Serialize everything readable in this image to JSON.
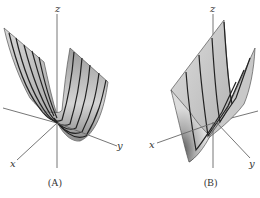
{
  "figures": [
    {
      "id": "A",
      "caption": "(A)",
      "axes": {
        "x": "x",
        "y": "y",
        "z": "z"
      },
      "surface": "parabolic cylinder trough, rulings parallel to y-axis direction"
    },
    {
      "id": "B",
      "caption": "(B)",
      "axes": {
        "x": "x",
        "y": "y",
        "z": "z"
      },
      "surface": "parabolic cylinder trough, rulings parallel to x-axis direction"
    }
  ],
  "colors": {
    "surface_light": "#e6e6e6",
    "surface_mid": "#b8b8b8",
    "surface_dark": "#7a7a7a",
    "axis": "#666666",
    "ruling": "#222222"
  }
}
